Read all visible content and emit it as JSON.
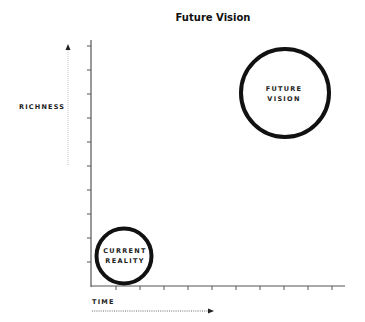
{
  "diagram": {
    "title": "Future Vision",
    "y_axis_label": "RICHNESS",
    "x_axis_label": "TIME",
    "nodes": [
      {
        "id": "current",
        "line1": "CURRENT",
        "line2": "REALITY"
      },
      {
        "id": "future",
        "line1": "FUTURE",
        "line2": "VISION"
      }
    ],
    "colors": {
      "stroke": "#111111",
      "arrow": "#bbbbbb",
      "axis": "#555555"
    }
  }
}
